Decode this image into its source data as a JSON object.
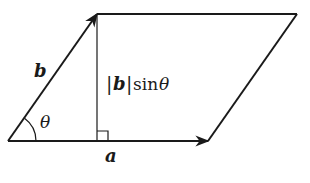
{
  "diagram": {
    "colors": {
      "stroke": "#1a1a1a",
      "background": "#ffffff"
    },
    "labels": {
      "vector_a": "a",
      "vector_b": "b",
      "angle": "θ",
      "height_bar_left": "|",
      "height_vec": "b",
      "height_bar_right": "|",
      "height_func": "sin",
      "height_angle": "θ"
    },
    "points": {
      "origin": [
        8,
        141
      ],
      "b_tip": [
        97,
        14
      ],
      "top_right": [
        297,
        14
      ],
      "a_tip": [
        208,
        141
      ],
      "foot": [
        97,
        141
      ]
    }
  }
}
